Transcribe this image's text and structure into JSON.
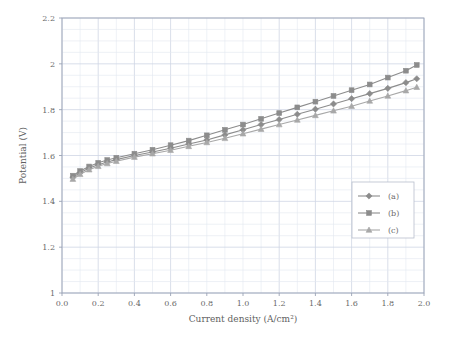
{
  "chart_data": {
    "type": "line",
    "title": "",
    "xlabel": "Current density (A/cm²)",
    "ylabel": "Potential (V)",
    "xlim": [
      0.0,
      2.0
    ],
    "ylim": [
      1.0,
      2.2
    ],
    "xticks": [
      "0.0",
      "0.2",
      "0.4",
      "0.6",
      "0.8",
      "1.0",
      "1.2",
      "1.4",
      "1.6",
      "1.8",
      "2.0"
    ],
    "yticks": [
      "1",
      "1.2",
      "1.4",
      "1.6",
      "1.8",
      "2",
      "2.2"
    ],
    "grid": true,
    "legend_position": "lower-right-inside",
    "series": [
      {
        "name": "(a)",
        "marker": "diamond",
        "color": "#8c8c8c",
        "x": [
          0.06,
          0.1,
          0.15,
          0.2,
          0.25,
          0.3,
          0.4,
          0.5,
          0.6,
          0.7,
          0.8,
          0.9,
          1.0,
          1.1,
          1.2,
          1.3,
          1.4,
          1.5,
          1.6,
          1.7,
          1.8,
          1.9,
          1.96
        ],
        "y": [
          1.505,
          1.525,
          1.545,
          1.56,
          1.572,
          1.582,
          1.6,
          1.615,
          1.632,
          1.65,
          1.668,
          1.69,
          1.712,
          1.735,
          1.757,
          1.78,
          1.802,
          1.825,
          1.848,
          1.87,
          1.893,
          1.918,
          1.935
        ]
      },
      {
        "name": "(b)",
        "marker": "square",
        "color": "#8c8c8c",
        "x": [
          0.06,
          0.1,
          0.15,
          0.2,
          0.25,
          0.3,
          0.4,
          0.5,
          0.6,
          0.7,
          0.8,
          0.9,
          1.0,
          1.1,
          1.2,
          1.3,
          1.4,
          1.5,
          1.6,
          1.7,
          1.8,
          1.9,
          1.96
        ],
        "y": [
          1.512,
          1.532,
          1.552,
          1.568,
          1.58,
          1.59,
          1.608,
          1.625,
          1.645,
          1.665,
          1.688,
          1.712,
          1.735,
          1.76,
          1.785,
          1.81,
          1.835,
          1.86,
          1.885,
          1.91,
          1.94,
          1.97,
          1.995
        ]
      },
      {
        "name": "(c)",
        "marker": "triangle",
        "color": "#a8a8a8",
        "x": [
          0.06,
          0.1,
          0.15,
          0.2,
          0.25,
          0.3,
          0.4,
          0.5,
          0.6,
          0.7,
          0.8,
          0.9,
          1.0,
          1.1,
          1.2,
          1.3,
          1.4,
          1.5,
          1.6,
          1.7,
          1.8,
          1.9,
          1.96
        ],
        "y": [
          1.497,
          1.518,
          1.538,
          1.553,
          1.565,
          1.575,
          1.593,
          1.608,
          1.623,
          1.64,
          1.657,
          1.675,
          1.695,
          1.715,
          1.735,
          1.755,
          1.775,
          1.795,
          1.815,
          1.838,
          1.86,
          1.883,
          1.898
        ]
      }
    ]
  }
}
